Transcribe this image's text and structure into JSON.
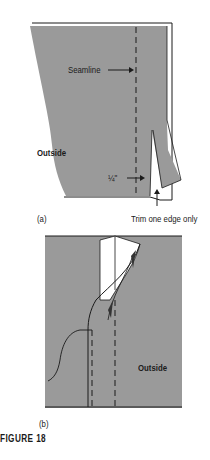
{
  "figure": {
    "caption": "FIGURE 18",
    "panel_a": {
      "label": "(a)",
      "seamline_label": "Seamline",
      "outside_label": "Outside",
      "quarter_inch_label": "¼\"",
      "trim_label": "Trim one edge only"
    },
    "panel_b": {
      "label": "(b)",
      "outside_label": "Outside"
    },
    "colors": {
      "fabric": "#9a9a9a",
      "line": "#1a1a1a",
      "background": "#ffffff"
    }
  }
}
